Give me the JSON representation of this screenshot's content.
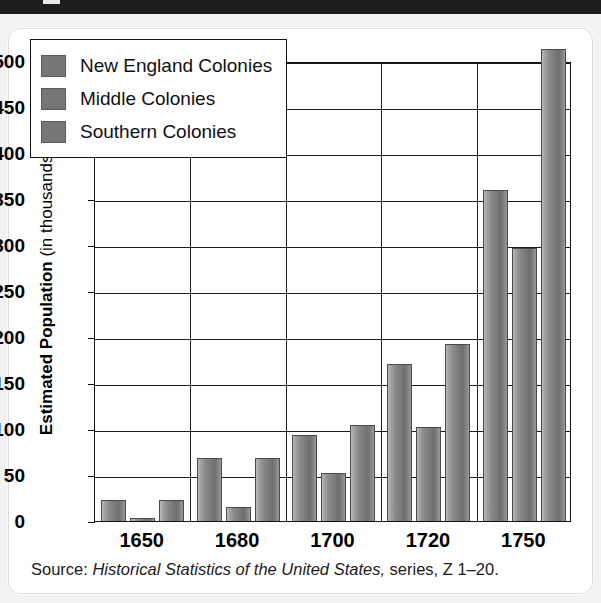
{
  "banner": {
    "tick_label": ""
  },
  "source": {
    "prefix": "Source: ",
    "italic_title": "Historical Statistics of the United States,",
    "suffix": " series, Z 1–20."
  },
  "legend": {
    "items": [
      {
        "label": "New England Colonies",
        "color": "#767676"
      },
      {
        "label": "Middle Colonies",
        "color": "#767676"
      },
      {
        "label": "Southern Colonies",
        "color": "#767676"
      }
    ]
  },
  "axis": {
    "y_title_strong": "Estimated Population",
    "y_title_light": " (in thousands)",
    "y_ticks": [
      "500",
      "450",
      "400",
      "350",
      "300",
      "250",
      "200",
      "150",
      "100",
      "50",
      "0"
    ],
    "x_ticks": [
      "1650",
      "1680",
      "1700",
      "1720",
      "1750"
    ]
  },
  "chart_data": {
    "type": "bar",
    "title": "",
    "subtitle": "",
    "xlabel": "",
    "ylabel": "Estimated Population (in thousands)",
    "categories": [
      "1650",
      "1680",
      "1700",
      "1720",
      "1750"
    ],
    "series": [
      {
        "name": "New England Colonies",
        "values": [
          23,
          68,
          93,
          171,
          360
        ]
      },
      {
        "name": "Middle Colonies",
        "values": [
          3,
          15,
          52,
          102,
          297
        ]
      },
      {
        "name": "Southern Colonies",
        "values": [
          23,
          68,
          104,
          192,
          513
        ]
      }
    ],
    "ylim": [
      0,
      500
    ],
    "ytick_step": 50,
    "grid": "horizontal-and-category-separators",
    "legend_position": "upper-left-inside",
    "note": "Bars may exceed the 500 gridline; Southern 1750 reaches about 513.",
    "source": "Historical Statistics of the United States, series, Z 1-20."
  }
}
